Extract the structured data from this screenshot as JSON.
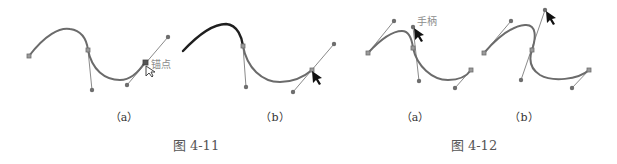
{
  "figures": [
    {
      "caption": "图 4-11",
      "panels": [
        {
          "label": "（a）",
          "annotation": "锚点"
        },
        {
          "label": "（b）"
        }
      ]
    },
    {
      "caption": "图 4-12",
      "panels": [
        {
          "label": "（a）",
          "annotation": "手柄"
        },
        {
          "label": "（b）"
        }
      ]
    }
  ],
  "colors": {
    "curve": "#6b6b6b",
    "curve_highlight": "#1f1f1f",
    "handle": "#8a8a8a",
    "text": "#555555",
    "annotation": "#8c8c8c"
  }
}
